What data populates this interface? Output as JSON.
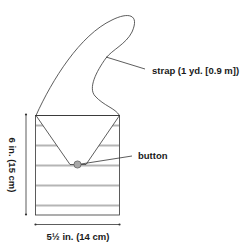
{
  "diagram": {
    "labels": {
      "strap": "strap (1 yd. [0.9 m])",
      "button": "button",
      "height": "6 in. (15 cm)",
      "width": "5½ in. (14 cm)"
    },
    "colors": {
      "outline": "#333333",
      "stripe": "#b5b5b5",
      "button_fill": "#a8a8a8",
      "text": "#1a1a1a"
    },
    "stripe_count": 5
  }
}
